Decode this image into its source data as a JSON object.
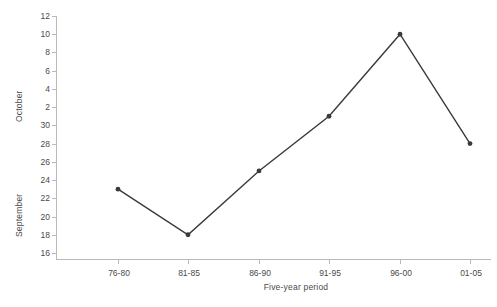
{
  "chart_data": {
    "type": "line",
    "title": "",
    "xlabel": "Five-year period",
    "ylabel_upper": "October",
    "ylabel_lower": "September",
    "categories": [
      "76-80",
      "81-85",
      "86-90",
      "91-95",
      "96-00",
      "01-05"
    ],
    "values": [
      23,
      18,
      25,
      31,
      40,
      28
    ],
    "value_labels": [
      "23 September",
      "18 September",
      "25 September",
      "1 October",
      "10 October",
      "28 September"
    ],
    "ytick_labels": [
      "12",
      "10",
      "8",
      "6",
      "4",
      "2",
      "30",
      "28",
      "26",
      "24",
      "22",
      "20",
      "18",
      "16"
    ],
    "ytick_values": [
      42,
      40,
      38,
      36,
      34,
      32,
      30,
      28,
      26,
      24,
      22,
      20,
      18,
      16
    ],
    "ylim": [
      16,
      42
    ],
    "grid": false,
    "legend": "none",
    "marker": "filled-circle",
    "line_color": "#3a3a3a",
    "axis_color": "#b9b9b9",
    "series_name": "Peak date"
  },
  "axes": {
    "x_title": "Five-year period",
    "y_title_upper": "October",
    "y_title_lower": "September"
  }
}
